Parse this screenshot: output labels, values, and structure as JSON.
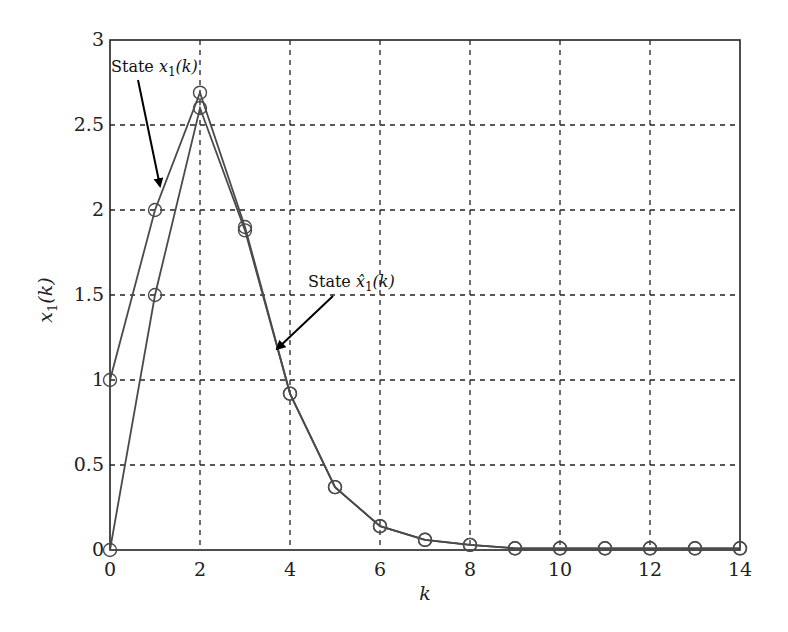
{
  "chart_data": {
    "type": "line",
    "title": "",
    "xlabel": "k",
    "ylabel": "x1(k)",
    "xlim": [
      0,
      14
    ],
    "ylim": [
      0,
      3
    ],
    "grid": true,
    "grid_style": "dashed",
    "x_ticks": [
      0,
      2,
      4,
      6,
      8,
      10,
      12,
      14
    ],
    "x_tick_labels": [
      "0",
      "2",
      "4",
      "6",
      "8",
      "10",
      "12",
      "14"
    ],
    "y_ticks": [
      0,
      0.5,
      1,
      1.5,
      2,
      2.5,
      3
    ],
    "y_tick_labels": [
      "0",
      "0.5",
      "1",
      "1.5",
      "2",
      "2.5",
      "3"
    ],
    "x": [
      0,
      1,
      2,
      3,
      4,
      5,
      6,
      7,
      8,
      9,
      10,
      11,
      12,
      13,
      14
    ],
    "series": [
      {
        "name": "State x1(k)",
        "marker": "circle",
        "color": "#4a4a4a",
        "values": [
          1,
          2,
          2.69,
          1.9,
          0.92,
          0.37,
          0.14,
          0.06,
          0.03,
          0.01,
          0.01,
          0.01,
          0.01,
          0.01,
          0.01
        ]
      },
      {
        "name": "State x̂1(k)",
        "marker": "circle",
        "color": "#4a4a4a",
        "values": [
          0,
          1.5,
          2.6,
          1.88,
          0.92,
          0.37,
          0.14,
          0.06,
          0.03,
          0.01,
          0.01,
          0.01,
          0.01,
          0.01,
          0.01
        ]
      }
    ],
    "annotations": [
      {
        "text_prefix": "State ",
        "math": "x",
        "subscript": "1",
        "suffix": "(k)",
        "hat": false,
        "label_pos": [
          111,
          72
        ],
        "arrow_from": [
          138,
          80
        ],
        "arrow_to": [
          160,
          186
        ]
      },
      {
        "text_prefix": "State ",
        "math": "x̂",
        "subscript": "1",
        "suffix": "(k)",
        "hat": true,
        "label_pos": [
          308,
          287
        ],
        "arrow_from": [
          333,
          296
        ],
        "arrow_to": [
          277,
          349
        ]
      }
    ],
    "legend": "none (annotated with arrows)"
  }
}
